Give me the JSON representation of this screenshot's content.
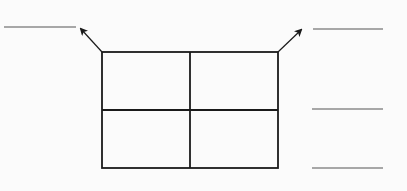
{
  "diagram": {
    "type": "2x2 grid with answer blanks",
    "colors": {
      "line": "#1a1a1a",
      "blank_line": "#555555",
      "background": "#fbfbfb"
    },
    "grid": {
      "rows": 2,
      "columns": 2,
      "left": 102,
      "top": 52,
      "right": 278,
      "bottom": 168,
      "mid_x": 190,
      "mid_y": 110
    },
    "arrows": [
      {
        "name": "top-left-arrow",
        "from": [
          102,
          52
        ],
        "to": [
          81,
          29
        ]
      },
      {
        "name": "top-right-arrow",
        "from": [
          278,
          52
        ],
        "to": [
          301,
          30
        ]
      }
    ],
    "answer_blanks": [
      {
        "name": "blank-top-left",
        "x1": 4,
        "x2": 76,
        "y": 27,
        "value": ""
      },
      {
        "name": "blank-top-right",
        "x1": 313,
        "x2": 383,
        "y": 29,
        "value": ""
      },
      {
        "name": "blank-middle-right",
        "x1": 312,
        "x2": 383,
        "y": 109,
        "value": ""
      },
      {
        "name": "blank-bottom-right",
        "x1": 312,
        "x2": 383,
        "y": 168,
        "value": ""
      }
    ]
  }
}
